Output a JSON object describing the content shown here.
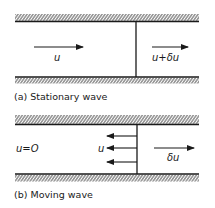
{
  "panel_a": {
    "caption": "(a) Stationary wave",
    "left_label": "u",
    "right_label": "u+δu"
  },
  "panel_b": {
    "caption": "(b) Moving wave",
    "left_label": "u=O",
    "wave_label": "u",
    "right_label": "δu"
  },
  "colors": {
    "ink": "#1a1a1a",
    "background": "#ffffff"
  }
}
